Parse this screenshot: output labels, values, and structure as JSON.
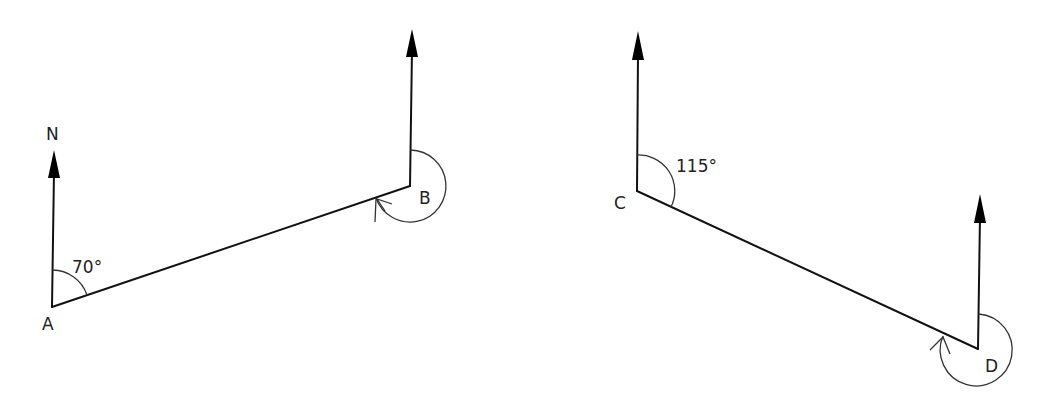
{
  "diagram": {
    "left_figure": {
      "north_label": "N",
      "point_a": {
        "label": "A"
      },
      "point_b": {
        "label": "B"
      },
      "angle_a": {
        "label": "70°",
        "value": 70
      },
      "angle_b": {
        "label": "",
        "type": "reflex bearing arc (clockwise from north)"
      }
    },
    "right_figure": {
      "point_c": {
        "label": "C"
      },
      "point_d": {
        "label": "D"
      },
      "angle_c": {
        "label": "115°",
        "value": 115
      },
      "angle_d": {
        "label": "",
        "type": "reflex bearing arc (clockwise from north)"
      }
    },
    "colors": {
      "line": "#111111",
      "background": "#ffffff"
    }
  }
}
